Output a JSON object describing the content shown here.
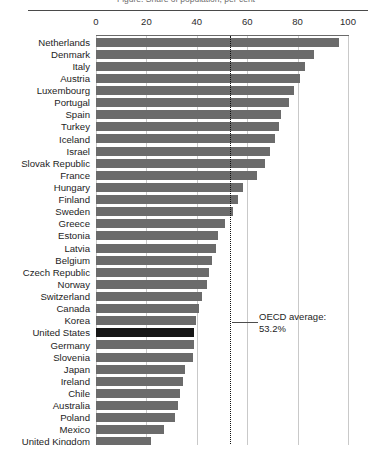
{
  "title_cut": "Figure: Share of population, per cent",
  "annotation": {
    "line1": "OECD average:",
    "line2": "53.2%"
  },
  "colors": {
    "bar": "#6b6b6b",
    "bar_highlight": "#161616",
    "grid": "#c9c9c9",
    "axis": "#6a6a6a",
    "average_line": "#111111",
    "text": "#1d1d1d"
  },
  "chart_data": {
    "type": "bar",
    "orientation": "horizontal",
    "title": "",
    "xlabel": "",
    "ylabel": "",
    "xlim": [
      0,
      100
    ],
    "xticks": [
      0,
      20,
      40,
      60,
      80,
      100
    ],
    "grid": true,
    "legend": "none",
    "highlight_category": "United States",
    "reference_line": {
      "label": "OECD average:",
      "value": 53.2,
      "value_label": "53.2%",
      "style": "dotted"
    },
    "categories": [
      "Netherlands",
      "Denmark",
      "Italy",
      "Austria",
      "Luxembourg",
      "Portugal",
      "Spain",
      "Turkey",
      "Iceland",
      "Israel",
      "Slovak Republic",
      "France",
      "Hungary",
      "Finland",
      "Sweden",
      "Greece",
      "Estonia",
      "Latvia",
      "Belgium",
      "Czech Republic",
      "Norway",
      "Switzerland",
      "Canada",
      "Korea",
      "United States",
      "Germany",
      "Slovenia",
      "Japan",
      "Ireland",
      "Chile",
      "Australia",
      "Poland",
      "Mexico",
      "United Kingdom"
    ],
    "values": [
      96.4,
      86.5,
      83.0,
      81.0,
      78.5,
      76.5,
      73.5,
      72.5,
      71.0,
      69.0,
      67.0,
      64.0,
      58.5,
      56.5,
      54.5,
      51.0,
      48.5,
      47.5,
      46.0,
      45.0,
      44.0,
      42.0,
      41.0,
      39.5,
      39.0,
      38.8,
      38.5,
      35.5,
      34.5,
      33.5,
      32.5,
      31.5,
      27.0,
      22.0
    ]
  }
}
